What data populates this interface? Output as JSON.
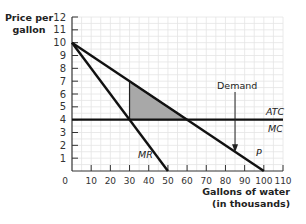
{
  "chart_data": {
    "type": "line",
    "title": "",
    "xlabel": "Gallons of water (in thousands)",
    "ylabel": "Price per gallon",
    "xlim": [
      0,
      110
    ],
    "ylim": [
      0,
      12
    ],
    "xticks": [
      0,
      10,
      20,
      30,
      40,
      50,
      60,
      70,
      80,
      90,
      100,
      110
    ],
    "yticks": [
      1,
      2,
      3,
      4,
      5,
      6,
      7,
      8,
      9,
      10,
      11,
      12
    ],
    "grid": true,
    "series": [
      {
        "name": "Demand",
        "label": "P",
        "x": [
          0,
          100
        ],
        "y": [
          10,
          0
        ]
      },
      {
        "name": "MR",
        "label": "MR",
        "x": [
          0,
          50
        ],
        "y": [
          10,
          0
        ]
      },
      {
        "name": "ATC = MC",
        "label": "ATC / MC",
        "x": [
          0,
          110
        ],
        "y": [
          4,
          4
        ]
      }
    ],
    "shaded_region": {
      "name": "deadweight loss",
      "color": "#a8a8a8",
      "vertices": [
        [
          30,
          7
        ],
        [
          30,
          4
        ],
        [
          60,
          4
        ]
      ]
    },
    "annotations": [
      {
        "text": "Demand",
        "arrow_to": [
          85,
          1.5
        ]
      },
      {
        "text": "ATC",
        "at": [
          105,
          4.5
        ]
      },
      {
        "text": "MC",
        "at": [
          105,
          3.5
        ]
      },
      {
        "text": "MR",
        "at": [
          45,
          1.2
        ]
      },
      {
        "text": "P",
        "at": [
          95,
          1.0
        ]
      }
    ]
  },
  "labels": {
    "ylabel_line1": "Price per",
    "ylabel_line2": "gallon",
    "xlabel_line1": "Gallons of water",
    "xlabel_line2": "(in thousands)",
    "demand": "Demand",
    "atc": "ATC",
    "mc": "MC",
    "mr": "MR",
    "p": "P"
  }
}
